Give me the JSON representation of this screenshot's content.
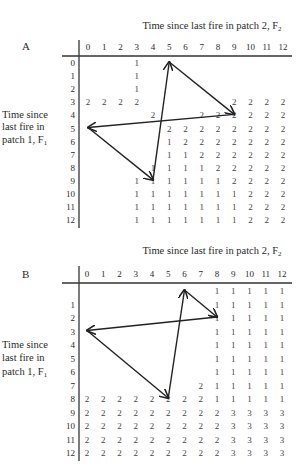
{
  "figure": {
    "panels": [
      {
        "label": "A",
        "title": "Time since last fire in patch 2, F",
        "title_sub": "2",
        "ylabel_lines": [
          "Time since",
          "last fire in",
          "patch 1, F"
        ],
        "ylabel_sub": "1",
        "col_labels": [
          "0",
          "1",
          "2",
          "3",
          "4",
          "5",
          "6",
          "7",
          "8",
          "9",
          "10",
          "11",
          "12"
        ],
        "row_labels": [
          "0",
          "1",
          "2",
          "3",
          "4",
          "5",
          "6",
          "7",
          "8",
          "9",
          "10",
          "11",
          "12"
        ],
        "cells": [
          [
            "",
            "",
            "",
            "1",
            "",
            "",
            "",
            "",
            "",
            "",
            "",
            "",
            ""
          ],
          [
            "",
            "",
            "",
            "1",
            "",
            "",
            "",
            "",
            "",
            "",
            "",
            "",
            ""
          ],
          [
            "",
            "",
            "",
            "1",
            "",
            "",
            "",
            "",
            "",
            "",
            "",
            "",
            ""
          ],
          [
            "2",
            "2",
            "2",
            "2",
            "",
            "",
            "",
            "",
            "",
            "2",
            "2",
            "2",
            "2"
          ],
          [
            "",
            "",
            "",
            "",
            "2",
            "",
            "",
            "2",
            "2",
            "2",
            "2",
            "2",
            "2"
          ],
          [
            "",
            "",
            "",
            "",
            "",
            "2",
            "2",
            "2",
            "2",
            "2",
            "2",
            "2",
            "2"
          ],
          [
            "",
            "",
            "",
            "",
            "",
            "1",
            "2",
            "2",
            "2",
            "2",
            "2",
            "2",
            "2"
          ],
          [
            "",
            "",
            "",
            "",
            "",
            "1",
            "1",
            "2",
            "2",
            "2",
            "2",
            "2",
            "2"
          ],
          [
            "",
            "",
            "",
            "",
            "1",
            "1",
            "1",
            "1",
            "2",
            "2",
            "2",
            "2",
            "2"
          ],
          [
            "",
            "",
            "",
            "1",
            "1",
            "1",
            "1",
            "1",
            "1",
            "2",
            "2",
            "2",
            "2"
          ],
          [
            "",
            "",
            "",
            "1",
            "1",
            "1",
            "1",
            "1",
            "1",
            "1",
            "2",
            "2",
            "2"
          ],
          [
            "",
            "",
            "",
            "1",
            "1",
            "1",
            "1",
            "1",
            "1",
            "1",
            "2",
            "2",
            "2"
          ],
          [
            "",
            "",
            "",
            "1",
            "1",
            "1",
            "1",
            "1",
            "1",
            "1",
            "2",
            "2",
            "2"
          ]
        ],
        "cycle": [
          [
            5,
            0
          ],
          [
            9,
            4
          ],
          [
            0,
            5
          ],
          [
            4,
            9
          ]
        ]
      },
      {
        "label": "B",
        "title": "Time since last fire in patch 2, F",
        "title_sub": "2",
        "ylabel_lines": [
          "Time since",
          "last fire in",
          "patch 1, F"
        ],
        "ylabel_sub": "1",
        "col_labels": [
          "0",
          "1",
          "2",
          "3",
          "4",
          "5",
          "6",
          "7",
          "8",
          "9",
          "10",
          "11",
          "12"
        ],
        "row_labels": [
          "",
          "1",
          "2",
          "3",
          "4",
          "5",
          "6",
          "7",
          "8",
          "9",
          "10",
          "11",
          "12"
        ],
        "cells": [
          [
            "",
            "",
            "",
            "",
            "",
            "",
            "",
            "",
            "1",
            "1",
            "1",
            "1",
            "1"
          ],
          [
            "",
            "",
            "",
            "",
            "",
            "",
            "",
            "",
            "1",
            "1",
            "1",
            "1",
            "1"
          ],
          [
            "",
            "",
            "",
            "",
            "",
            "",
            "",
            "",
            "1",
            "1",
            "1",
            "1",
            "1"
          ],
          [
            "",
            "",
            "",
            "",
            "",
            "",
            "",
            "",
            "1",
            "1",
            "1",
            "1",
            "1"
          ],
          [
            "",
            "",
            "",
            "",
            "",
            "",
            "",
            "",
            "1",
            "1",
            "1",
            "1",
            "1"
          ],
          [
            "",
            "",
            "",
            "",
            "",
            "",
            "",
            "",
            "1",
            "1",
            "1",
            "1",
            "1"
          ],
          [
            "",
            "",
            "",
            "",
            "",
            "",
            "",
            "",
            "1",
            "1",
            "1",
            "1",
            "1"
          ],
          [
            "",
            "",
            "",
            "",
            "",
            "",
            "",
            "2",
            "1",
            "1",
            "1",
            "1",
            "1"
          ],
          [
            "2",
            "2",
            "2",
            "2",
            "2",
            "2",
            "2",
            "2",
            "1",
            "1",
            "1",
            "1",
            "1"
          ],
          [
            "2",
            "2",
            "2",
            "2",
            "2",
            "2",
            "2",
            "2",
            "2",
            "3",
            "3",
            "3",
            "3"
          ],
          [
            "2",
            "2",
            "2",
            "2",
            "2",
            "2",
            "2",
            "2",
            "2",
            "3",
            "3",
            "3",
            "3"
          ],
          [
            "2",
            "2",
            "2",
            "2",
            "2",
            "2",
            "2",
            "2",
            "2",
            "3",
            "3",
            "3",
            "3"
          ],
          [
            "2",
            "2",
            "2",
            "2",
            "2",
            "2",
            "2",
            "2",
            "2",
            "3",
            "3",
            "3",
            "3"
          ]
        ],
        "cycle": [
          [
            6,
            0
          ],
          [
            8,
            2
          ],
          [
            0,
            3
          ],
          [
            5,
            8
          ]
        ]
      }
    ]
  }
}
